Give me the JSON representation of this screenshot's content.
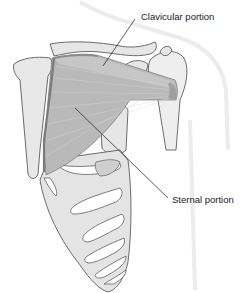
{
  "figure": {
    "labels": [
      {
        "id": "clavicular",
        "text": "Clavicular portion"
      },
      {
        "id": "sternal",
        "text": "Sternal portion"
      }
    ]
  },
  "colors": {
    "background": "#ffffff",
    "muscle": "#b9b9b9",
    "muscle_dark": "#8a8a8a",
    "bone": "#e6e6e6",
    "outline": "#4a4a4a",
    "body_silhouette": "#efefef",
    "leader_line": "#1a1a1a"
  }
}
